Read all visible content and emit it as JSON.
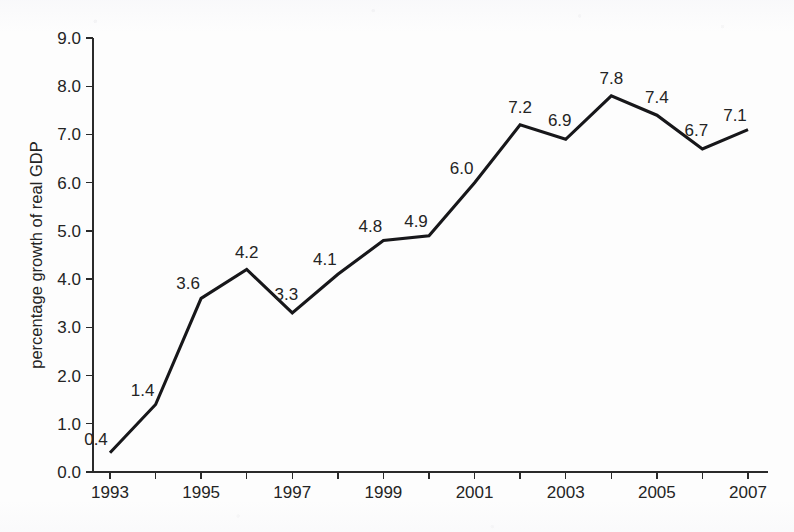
{
  "chart_data": {
    "type": "line",
    "title": "",
    "subtitle": "",
    "xlabel": "",
    "ylabel": "percentage growth of real GDP",
    "x": [
      1993,
      1994,
      1995,
      1996,
      1997,
      1998,
      1999,
      2000,
      2001,
      2002,
      2003,
      2004,
      2005,
      2006,
      2007
    ],
    "values": [
      0.4,
      1.4,
      3.6,
      4.2,
      3.3,
      4.1,
      4.8,
      4.9,
      6.0,
      7.2,
      6.9,
      7.8,
      7.4,
      6.7,
      7.1
    ],
    "series": [
      {
        "name": "percentage growth of real GDP",
        "values": [
          0.4,
          1.4,
          3.6,
          4.2,
          3.3,
          4.1,
          4.8,
          4.9,
          6.0,
          7.2,
          6.9,
          7.8,
          7.4,
          6.7,
          7.1
        ]
      }
    ],
    "point_labels": [
      "0.4",
      "1.4",
      "3.6",
      "4.2",
      "3.3",
      "4.1",
      "4.8",
      "4.9",
      "6.0",
      "7.2",
      "6.9",
      "7.8",
      "7.4",
      "6.7",
      "7.1"
    ],
    "xlim": [
      1993,
      2007
    ],
    "ylim": [
      0.0,
      9.0
    ],
    "ytick_values": [
      0.0,
      1.0,
      2.0,
      3.0,
      4.0,
      5.0,
      6.0,
      7.0,
      8.0,
      9.0
    ],
    "ytick_labels": [
      "0.0",
      "1.0",
      "2.0",
      "3.0",
      "4.0",
      "5.0",
      "6.0",
      "7.0",
      "8.0",
      "9.0"
    ],
    "xtick_values": [
      1993,
      1994,
      1995,
      1996,
      1997,
      1998,
      1999,
      2000,
      2001,
      2002,
      2003,
      2004,
      2005,
      2006,
      2007
    ],
    "xtick_labels": [
      "1993",
      "",
      "1995",
      "",
      "1997",
      "",
      "1999",
      "",
      "2001",
      "",
      "2003",
      "",
      "2005",
      "",
      "2007"
    ],
    "grid": false,
    "legend": false,
    "legend_position": "none",
    "markers": false,
    "line_color": "#17171a",
    "axis_color": "#2a2a2a",
    "text_color": "#242424",
    "background_color": "#fdfdfd"
  }
}
